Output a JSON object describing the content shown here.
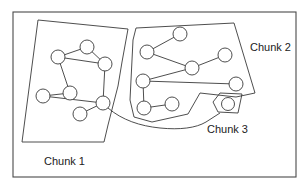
{
  "diagram": {
    "type": "graph-partition",
    "chunks": [
      {
        "id": "chunk1",
        "label": "Chunk 1",
        "nodes": [
          "A",
          "B",
          "C",
          "D",
          "E",
          "F",
          "G"
        ]
      },
      {
        "id": "chunk2",
        "label": "Chunk 2",
        "nodes": [
          "H",
          "I",
          "J",
          "K",
          "L",
          "M",
          "N",
          "O"
        ]
      },
      {
        "id": "chunk3",
        "label": "Chunk 3",
        "nodes": [
          "P"
        ]
      }
    ],
    "edges": [
      [
        "B",
        "A"
      ],
      [
        "A",
        "C"
      ],
      [
        "B",
        "C"
      ],
      [
        "B",
        "D"
      ],
      [
        "D",
        "E"
      ],
      [
        "E",
        "F"
      ],
      [
        "C",
        "F"
      ],
      [
        "F",
        "G"
      ],
      [
        "I",
        "H"
      ],
      [
        "I",
        "K"
      ],
      [
        "K",
        "J"
      ],
      [
        "K",
        "L"
      ],
      [
        "L",
        "M"
      ],
      [
        "L",
        "N"
      ],
      [
        "N",
        "O"
      ]
    ],
    "colors": {
      "stroke": "#3a3a3a",
      "background": "#ffffff",
      "text": "#222222"
    }
  }
}
